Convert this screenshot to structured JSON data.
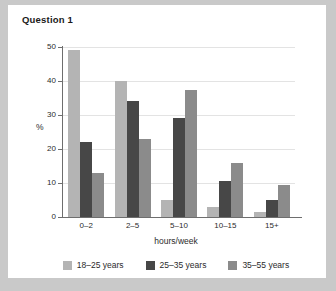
{
  "card": {
    "title": "Question 1"
  },
  "chart_data": {
    "type": "bar",
    "title": "Question 1",
    "xlabel": "hours/week",
    "ylabel": "%",
    "categories": [
      "0–2",
      "2–5",
      "5–10",
      "10–15",
      "15+"
    ],
    "series": [
      {
        "name": "18–25 years",
        "color": "#b4b4b4",
        "values": [
          49,
          40,
          5,
          3,
          1.5
        ]
      },
      {
        "name": "25–35 years",
        "color": "#474747",
        "values": [
          22,
          34,
          29,
          10.5,
          5
        ]
      },
      {
        "name": "35–55 years",
        "color": "#8b8b8b",
        "values": [
          13,
          23,
          37.5,
          16,
          9.5
        ]
      }
    ],
    "ylim": [
      0,
      50
    ],
    "yticks": [
      0,
      10,
      20,
      30,
      40,
      50
    ],
    "ytick_labels": [
      "0",
      "10",
      "20",
      "30",
      "40",
      "50"
    ],
    "grid": true,
    "legend_position": "bottom"
  }
}
